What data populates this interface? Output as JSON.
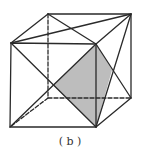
{
  "figure": {
    "caption": "( b )",
    "shade_color": "#bdbdbd",
    "line_color": "#2a2a2a",
    "vertices": {
      "front_top_left": [
        11,
        43
      ],
      "front_top_right": [
        96,
        44
      ],
      "front_bottom_right": [
        96,
        127
      ],
      "front_bottom_left": [
        10,
        127
      ],
      "back_top_left": [
        48,
        14
      ],
      "back_top_right": [
        131,
        14
      ],
      "back_bottom_right": [
        131,
        98
      ],
      "back_bottom_left": [
        48,
        98
      ]
    },
    "shaded_region": [
      [
        96,
        44
      ],
      [
        53,
        85
      ],
      [
        96,
        127
      ],
      [
        112,
        70
      ]
    ]
  }
}
